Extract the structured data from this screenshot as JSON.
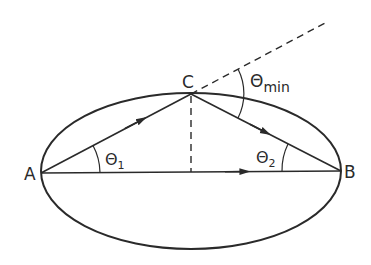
{
  "diagram": {
    "points": {
      "A": {
        "label": "A",
        "x": 41,
        "y": 172
      },
      "B": {
        "label": "B",
        "x": 341,
        "y": 171
      },
      "C": {
        "label": "C",
        "x": 191,
        "y": 94
      }
    },
    "angles": {
      "theta1": {
        "symbol": "Θ",
        "subscript": "1"
      },
      "theta2": {
        "symbol": "Θ",
        "subscript": "2"
      },
      "theta_min": {
        "symbol": "Θ",
        "subscript": "min"
      }
    },
    "colors": {
      "stroke": "#2a2a2a",
      "background": "#ffffff"
    }
  }
}
